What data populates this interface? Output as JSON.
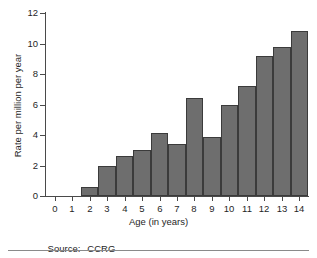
{
  "chart_data": {
    "type": "bar",
    "title": "",
    "xlabel": "Age (in years)",
    "ylabel": "Rate per million per year",
    "categories": [
      "0",
      "1",
      "2",
      "3",
      "4",
      "5",
      "6",
      "7",
      "8",
      "9",
      "10",
      "11",
      "12",
      "13",
      "14"
    ],
    "values": [
      0,
      0,
      0.6,
      1.95,
      2.65,
      3.0,
      4.1,
      3.4,
      6.45,
      3.9,
      6.0,
      7.2,
      9.2,
      9.8,
      10.8
    ],
    "xlim": [
      -0.5,
      14.5
    ],
    "ylim": [
      0,
      12
    ],
    "yticks": [
      0,
      2,
      4,
      6,
      8,
      10,
      12
    ],
    "ytick_labels": [
      "0",
      "2",
      "4",
      "6",
      "8",
      "10",
      "12"
    ],
    "xticks": [
      0,
      1,
      2,
      3,
      4,
      5,
      6,
      7,
      8,
      9,
      10,
      11,
      12,
      13,
      14
    ],
    "xtick_labels": [
      "0",
      "1",
      "2",
      "3",
      "4",
      "5",
      "6",
      "7",
      "8",
      "9",
      "10",
      "11",
      "12",
      "13",
      "14"
    ],
    "grid": false,
    "legend": null,
    "bar_color": "#6e6e6e",
    "bar_edge_color": "#3b3b3b",
    "axis_color": "#4a4a4a"
  },
  "footer": {
    "source_label": "Source:",
    "source_value": "CCRG"
  }
}
